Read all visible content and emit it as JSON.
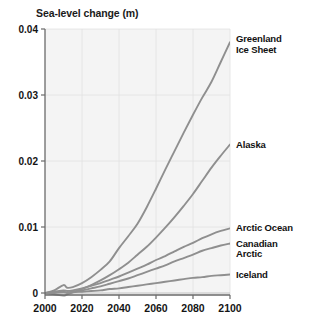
{
  "chart_data": {
    "type": "line",
    "title": "Sea-level change (m)",
    "xlabel": "",
    "ylabel": "Sea-level change (m)",
    "xlim": [
      2000,
      2100
    ],
    "ylim": [
      -0.0015,
      0.04
    ],
    "xticks": [
      2000,
      2020,
      2040,
      2060,
      2080,
      2100
    ],
    "xtick_labels": [
      "2000",
      "2020",
      "2040",
      "2060",
      "2080",
      "2100"
    ],
    "yticks": [
      0,
      0.01,
      0.02,
      0.03,
      0.04
    ],
    "ytick_labels": [
      "0",
      "0.01",
      "0.02",
      "0.03",
      "0.04"
    ],
    "grid": true,
    "legend_position": "right-of-axes-inline",
    "line_color": "#8f8f8f",
    "plot_bg": "#f4f4f4",
    "x": [
      2000,
      2005,
      2010,
      2012,
      2015,
      2020,
      2025,
      2030,
      2035,
      2040,
      2045,
      2050,
      2055,
      2060,
      2065,
      2070,
      2075,
      2080,
      2085,
      2090,
      2095,
      2100
    ],
    "series": [
      {
        "name": "Greenland Ice Sheet",
        "label": "Greenland\nIce Sheet",
        "values": [
          0.0,
          0.0004,
          0.0012,
          0.0008,
          0.0009,
          0.0015,
          0.0024,
          0.0035,
          0.0048,
          0.0068,
          0.0086,
          0.0105,
          0.013,
          0.0158,
          0.0187,
          0.0215,
          0.0243,
          0.027,
          0.0296,
          0.032,
          0.035,
          0.038
        ]
      },
      {
        "name": "Alaska",
        "label": "Alaska",
        "values": [
          0.0,
          -0.0002,
          -0.0004,
          -0.0002,
          0.0001,
          0.0006,
          0.0012,
          0.0019,
          0.0027,
          0.0036,
          0.0046,
          0.0058,
          0.007,
          0.0084,
          0.0099,
          0.0115,
          0.0132,
          0.015,
          0.017,
          0.019,
          0.0208,
          0.0225
        ]
      },
      {
        "name": "Arctic Ocean",
        "label": "Arctic Ocean",
        "values": [
          0.0,
          0.0002,
          0.0004,
          0.0003,
          0.0004,
          0.0007,
          0.0011,
          0.0015,
          0.002,
          0.0025,
          0.0031,
          0.0037,
          0.0043,
          0.005,
          0.0056,
          0.0063,
          0.007,
          0.0076,
          0.0083,
          0.0089,
          0.0094,
          0.0098
        ]
      },
      {
        "name": "Canadian Arctic",
        "label": "Canadian\nArctic",
        "values": [
          0.0,
          0.0001,
          0.0002,
          0.0001,
          0.0002,
          0.0004,
          0.0007,
          0.001,
          0.0014,
          0.0018,
          0.0022,
          0.0027,
          0.0032,
          0.0037,
          0.0042,
          0.0048,
          0.0053,
          0.0058,
          0.0064,
          0.0068,
          0.0072,
          0.0075
        ]
      },
      {
        "name": "Iceland",
        "label": "Iceland",
        "values": [
          0.0,
          0.0,
          0.0001,
          0.0,
          0.0001,
          0.0002,
          0.0003,
          0.0004,
          0.0006,
          0.0007,
          0.0009,
          0.0011,
          0.0013,
          0.0015,
          0.0017,
          0.0019,
          0.0021,
          0.0023,
          0.0024,
          0.0026,
          0.0027,
          0.0028
        ]
      }
    ]
  },
  "labels": {
    "greenland": "Greenland\nIce Sheet",
    "alaska": "Alaska",
    "arctic_ocean": "Arctic Ocean",
    "canadian_arctic": "Canadian\nArctic",
    "iceland": "Iceland"
  }
}
